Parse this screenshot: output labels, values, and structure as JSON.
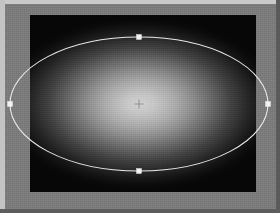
{
  "window": {
    "title": "Ellipse Selection Canvas",
    "surface_color": "#7b7b7b",
    "frame_highlight_color": "#c9c9c9",
    "frame_shadow_color": "#5a5a5a"
  },
  "document": {
    "name": "image-document",
    "background_color": "#080808",
    "x": 30,
    "y": 15,
    "width": 226,
    "height": 177
  },
  "glow": {
    "name": "radial-light-glow",
    "center_color": "#d2d2d2",
    "edge_color": "#070707",
    "center_x": 140,
    "center_y": 104,
    "radius_x": 96,
    "radius_y": 52
  },
  "selection": {
    "name": "ellipse-selection",
    "shape": "ellipse",
    "stroke_color": "#e8e8e4",
    "stroke_width": 1,
    "center_x": 139,
    "center_y": 104,
    "radius_x": 129,
    "radius_y": 67,
    "handle_color": "#f2f2ee",
    "handles": [
      {
        "name": "handle-top",
        "x": 139,
        "y": 37,
        "size": 5
      },
      {
        "name": "handle-right",
        "x": 268,
        "y": 104,
        "size": 5
      },
      {
        "name": "handle-bottom",
        "x": 139,
        "y": 171,
        "size": 5
      },
      {
        "name": "handle-left",
        "x": 10,
        "y": 104,
        "size": 5
      }
    ],
    "center_marker": {
      "name": "center-crosshair",
      "x": 139,
      "y": 104,
      "size": 9,
      "color": "#8c8c8c"
    }
  }
}
